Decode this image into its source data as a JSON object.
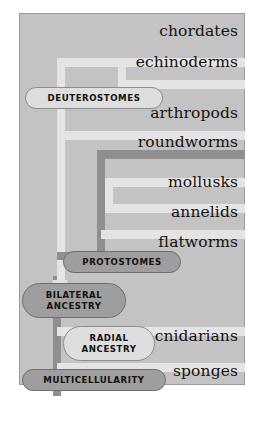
{
  "figure": {
    "kind": "phylogenetic-tree",
    "colors": {
      "panel_background": "#c3c3c3",
      "panel_border": "#9a9a9a",
      "pale_branch": "#e4e4e4",
      "dark_branch": "#8f8f8f",
      "pill_pale_fill": "#dedede",
      "pill_pale_border": "#8d8d8d",
      "pill_dark_fill": "#9e9e9e",
      "pill_dark_border": "#6f6f6f",
      "text": "#16120f"
    }
  },
  "taxa": [
    {
      "id": "chordates",
      "label": "chordates"
    },
    {
      "id": "echinoderms",
      "label": "echinoderms"
    },
    {
      "id": "arthropods",
      "label": "arthropods"
    },
    {
      "id": "roundworms",
      "label": "roundworms"
    },
    {
      "id": "mollusks",
      "label": "mollusks"
    },
    {
      "id": "annelids",
      "label": "annelids"
    },
    {
      "id": "flatworms",
      "label": "flatworms"
    },
    {
      "id": "cnidarians",
      "label": "cnidarians"
    },
    {
      "id": "sponges",
      "label": "sponges"
    }
  ],
  "nodes": [
    {
      "id": "deuterostomes",
      "label": "DEUTEROSTOMES",
      "style": "pale"
    },
    {
      "id": "protostomes",
      "label": "PROTOSTOMES",
      "style": "dark"
    },
    {
      "id": "bilateral",
      "label": "BILATERAL\nANCESTRY",
      "line1": "BILATERAL",
      "line2": "ANCESTRY",
      "style": "dark"
    },
    {
      "id": "radial",
      "label": "RADIAL\nANCESTRY",
      "line1": "RADIAL",
      "line2": "ANCESTRY",
      "style": "pale"
    },
    {
      "id": "multicellularity",
      "label": "MULTICELLULARITY",
      "style": "dark"
    }
  ]
}
